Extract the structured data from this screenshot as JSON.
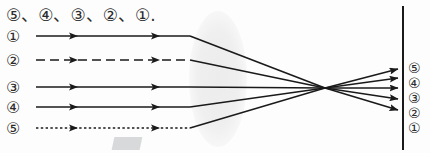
{
  "header": {
    "text": "⑤、④、③、②、①."
  },
  "colors": {
    "ink": "#2b2b2b",
    "ray": "#1a1a1a",
    "lens_fill": "#f0f0f0",
    "screen": "#1a1a1a",
    "background": "#fdfdfd"
  },
  "optics": {
    "lens": {
      "name": "converging-lens",
      "cx": 218,
      "cy": 79,
      "rx": 29,
      "ry": 68
    },
    "focus_point": {
      "x": 325,
      "y": 88
    },
    "screen_line": {
      "x": 403,
      "y_top": 6,
      "y_bottom": 150
    }
  },
  "incoming_rays": [
    {
      "label": "①",
      "label_x": 6,
      "label_y": 27,
      "y": 36,
      "x_start": 36,
      "x_end": 190,
      "style": "solid",
      "arrows_at": [
        78,
        160
      ]
    },
    {
      "label": "②",
      "label_x": 6,
      "label_y": 51,
      "y": 60,
      "x_start": 36,
      "x_end": 190,
      "style": "dashed",
      "arrows_at": [
        78,
        160
      ]
    },
    {
      "label": "③",
      "label_x": 6,
      "label_y": 78,
      "y": 87,
      "x_start": 36,
      "x_end": 190,
      "style": "solid",
      "arrows_at": [
        78,
        160
      ]
    },
    {
      "label": "④",
      "label_x": 6,
      "label_y": 98,
      "y": 107,
      "x_start": 36,
      "x_end": 190,
      "style": "solid",
      "arrows_at": [
        78,
        160
      ]
    },
    {
      "label": "⑤",
      "label_x": 6,
      "label_y": 119,
      "y": 128,
      "x_start": 36,
      "x_end": 190,
      "style": "dotted",
      "arrows_at": [
        78,
        160
      ]
    }
  ],
  "image_labels": [
    {
      "label": "⑤",
      "label_x": 408,
      "label_y": 60,
      "arrow_y": 69
    },
    {
      "label": "④",
      "label_x": 408,
      "label_y": 75,
      "arrow_y": 78
    },
    {
      "label": "③",
      "label_x": 408,
      "label_y": 90,
      "arrow_y": 88
    },
    {
      "label": "②",
      "label_x": 408,
      "label_y": 105,
      "arrow_y": 99
    },
    {
      "label": "①",
      "label_x": 408,
      "label_y": 120,
      "arrow_y": 110
    }
  ],
  "refracted_rays": [
    {
      "from_ray": "①",
      "x1": 190,
      "y1": 36,
      "x2": 325,
      "y2": 88,
      "x3": 398,
      "y3": 110
    },
    {
      "from_ray": "②",
      "x1": 190,
      "y1": 60,
      "x2": 325,
      "y2": 88,
      "x3": 398,
      "y3": 99
    },
    {
      "from_ray": "③",
      "x1": 190,
      "y1": 87,
      "x2": 325,
      "y2": 88,
      "x3": 398,
      "y3": 88
    },
    {
      "from_ray": "④",
      "x1": 190,
      "y1": 107,
      "x2": 325,
      "y2": 88,
      "x3": 398,
      "y3": 78
    },
    {
      "from_ray": "⑤",
      "x1": 190,
      "y1": 128,
      "x2": 325,
      "y2": 88,
      "x3": 398,
      "y3": 69
    }
  ]
}
